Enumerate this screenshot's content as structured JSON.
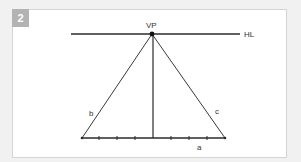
{
  "figure": {
    "number": "2",
    "badge_color": "#b3b3b3",
    "labels": {
      "vanishing_point": "VP",
      "horizon_line": "HL",
      "left_line": "b",
      "right_line": "c",
      "baseline": "a"
    },
    "geometry": {
      "vanishing_point": [
        152,
        34
      ],
      "horizon_line": {
        "x1": 71,
        "x2": 240,
        "y": 34
      },
      "baseline": {
        "x1": 82,
        "x2": 225,
        "y": 138
      },
      "tick_marks_x": [
        99,
        117,
        135,
        153,
        171,
        189,
        207
      ],
      "center_vertical": {
        "x": 153,
        "y1": 34,
        "y2": 138
      }
    },
    "line_color": "#2b2b2b"
  }
}
